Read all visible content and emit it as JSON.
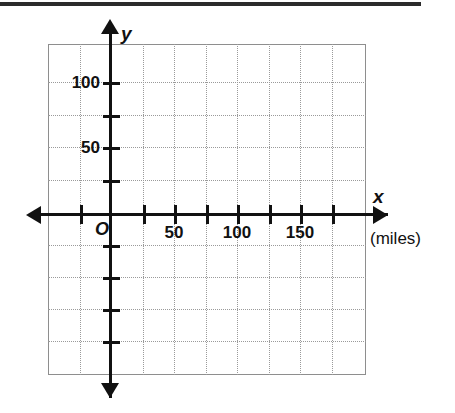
{
  "figure": {
    "kind": "coordinate-grid",
    "background_color": "#ffffff",
    "axis_color": "#111111",
    "grid_color": "#9a9a9a",
    "frame_color": "#8e8e8e",
    "origin_label": "O",
    "x_axis_name": "x",
    "y_axis_name": "y",
    "x_unit_label": "(miles)"
  },
  "chart_data": {
    "type": "scatter",
    "title": "",
    "xlabel": "x",
    "ylabel": "y",
    "x_unit": "(miles)",
    "grid": true,
    "legend": "none",
    "origin_label": "O",
    "xlim": [
      -50,
      200
    ],
    "ylim": [
      -125,
      125
    ],
    "x_major_ticks": [
      0,
      25,
      50,
      75,
      100,
      125,
      150,
      175
    ],
    "y_major_ticks": [
      -100,
      -75,
      -50,
      -25,
      0,
      25,
      50,
      75,
      100
    ],
    "x_tick_labels": [
      {
        "value": 50,
        "text": "50"
      },
      {
        "value": 100,
        "text": "100"
      },
      {
        "value": 150,
        "text": "150"
      }
    ],
    "y_tick_labels": [
      {
        "value": 50,
        "text": "50"
      },
      {
        "value": 100,
        "text": "100"
      }
    ],
    "x_gridlines": [
      -25,
      25,
      50,
      75,
      100,
      125,
      150,
      175
    ],
    "y_gridlines": [
      -100,
      -75,
      -50,
      -25,
      25,
      50,
      75,
      100
    ],
    "series": [],
    "values": [],
    "x": [],
    "annotations": []
  },
  "geometry": {
    "x_ticks_px": [
      80,
      143,
      174,
      206,
      237,
      269,
      300,
      332
    ],
    "y_ticks_px": [
      82,
      115,
      147,
      180,
      245,
      277,
      309,
      341
    ],
    "x_gridlines_px": [
      80,
      143,
      174,
      206,
      237,
      269,
      300,
      332
    ],
    "y_gridlines_px": [
      82,
      115,
      147,
      180,
      245,
      277,
      309,
      341
    ],
    "x_tick_labels_px": [
      {
        "left": 174,
        "text": "50"
      },
      {
        "left": 237,
        "text": "100"
      },
      {
        "left": 300,
        "text": "150"
      }
    ],
    "y_tick_labels_px": [
      {
        "top": 147,
        "text": "50"
      },
      {
        "top": 82,
        "text": "100"
      }
    ]
  }
}
